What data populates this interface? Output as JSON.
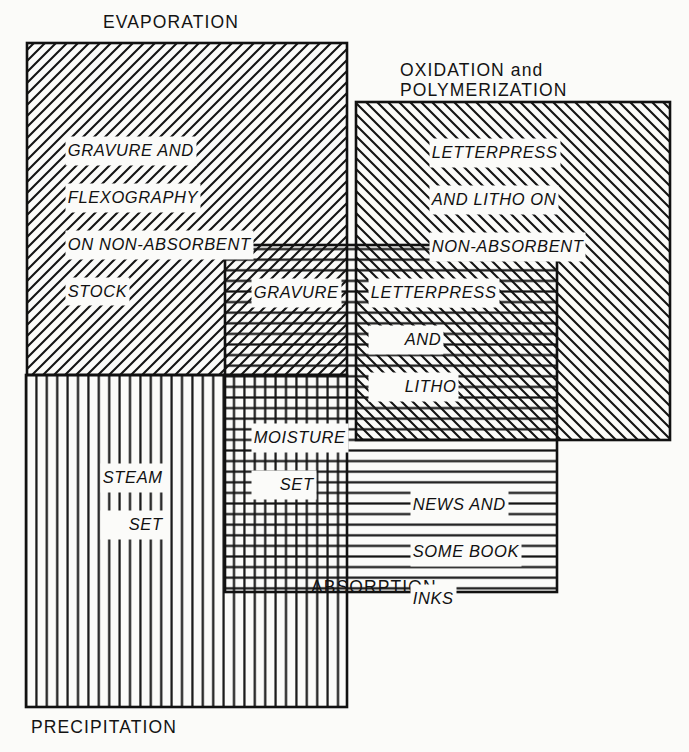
{
  "diagram": {
    "background_color": "#fbfbf9",
    "ink_color": "#111111",
    "captions": {
      "evaporation": "EVAPORATION",
      "oxidation": "OXIDATION and\nPOLYMERIZATION",
      "absorption": "ABSORPTION",
      "precipitation": "PRECIPITATION"
    },
    "sets": [
      {
        "key": "evaporation",
        "name": "EVAPORATION",
        "hatch": "diagonal-forward",
        "rect": {
          "x": 27,
          "y": 43,
          "w": 320,
          "h": 332
        }
      },
      {
        "key": "oxidation",
        "name": "OXIDATION and POLYMERIZATION",
        "hatch": "diagonal-backward",
        "rect": {
          "x": 356,
          "y": 102,
          "w": 314,
          "h": 338
        }
      },
      {
        "key": "absorption",
        "name": "ABSORPTION",
        "hatch": "horizontal",
        "rect": {
          "x": 225,
          "y": 245,
          "w": 332,
          "h": 347
        }
      },
      {
        "key": "precipitation",
        "name": "PRECIPITATION",
        "hatch": "vertical",
        "rect": {
          "x": 26,
          "y": 375,
          "w": 321,
          "h": 332
        }
      }
    ],
    "zone_labels": [
      {
        "key": "gravure-flexography",
        "lines": [
          "GRAVURE AND",
          "FLEXOGRAPHY",
          "ON NON-ABSORBENT",
          "STOCK"
        ],
        "belongs_to": [
          "evaporation"
        ],
        "align": "left"
      },
      {
        "key": "letterpress-litho-nonabsorbent",
        "lines": [
          "LETTERPRESS",
          "AND LITHO ON",
          "NON-ABSORBENT",
          "STOCK"
        ],
        "belongs_to": [
          "oxidation"
        ],
        "align": "left"
      },
      {
        "key": "gravure",
        "lines": [
          "GRAVURE"
        ],
        "belongs_to": [
          "evaporation",
          "absorption"
        ],
        "align": "left"
      },
      {
        "key": "letterpress-and-litho",
        "lines": [
          "LETTERPRESS",
          "AND",
          "LITHO"
        ],
        "belongs_to": [
          "oxidation",
          "absorption"
        ],
        "align": "center"
      },
      {
        "key": "moisture-set",
        "lines": [
          "MOISTURE",
          "SET"
        ],
        "belongs_to": [
          "absorption",
          "precipitation"
        ],
        "align": "center"
      },
      {
        "key": "steam-set",
        "lines": [
          "STEAM",
          "SET"
        ],
        "belongs_to": [
          "precipitation"
        ],
        "align": "center"
      },
      {
        "key": "news-and-some-book-inks",
        "lines": [
          "NEWS AND",
          "SOME BOOK",
          "INKS"
        ],
        "belongs_to": [
          "absorption"
        ],
        "align": "left"
      }
    ]
  }
}
